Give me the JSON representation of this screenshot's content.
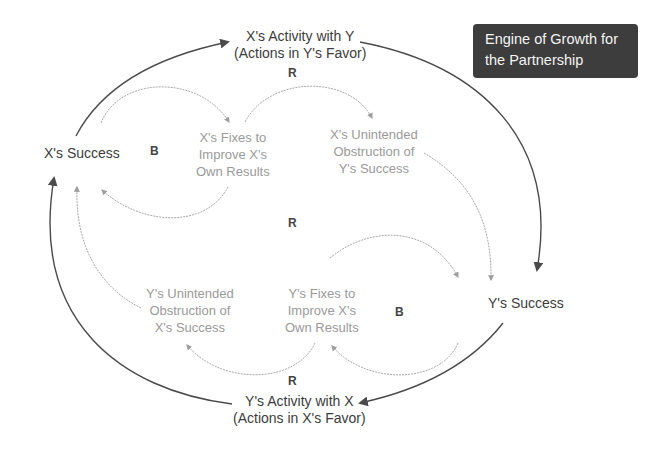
{
  "title_box": {
    "lines": [
      "Engine of Growth for",
      "the Partnership"
    ],
    "background": "#3d3d3d",
    "text_color": "#f4f4f4"
  },
  "nodes": {
    "x_success": {
      "lines": [
        "X's Success"
      ]
    },
    "y_success": {
      "lines": [
        "Y's Success"
      ]
    },
    "x_activity": {
      "lines": [
        "X's Activity with Y",
        "(Actions in Y's Favor)"
      ]
    },
    "y_activity": {
      "lines": [
        "Y's Activity with X",
        "(Actions in X's Favor)"
      ]
    },
    "x_fixes": {
      "lines": [
        "X's Fixes to",
        "Improve X's",
        "Own Results"
      ]
    },
    "x_obstruction": {
      "lines": [
        "X's Unintended",
        "Obstruction of",
        "Y's Success"
      ]
    },
    "y_fixes": {
      "lines": [
        "Y's Fixes to",
        "Improve X's",
        "Own Results"
      ]
    },
    "y_obstruction": {
      "lines": [
        "Y's Unintended",
        "Obstruction of",
        "X's Success"
      ]
    }
  },
  "loop_labels": {
    "top_r": "R",
    "left_b": "B",
    "center_r": "R",
    "right_b": "B",
    "bottom_r": "R"
  },
  "colors": {
    "main_arrow": "#4a4a4a",
    "light_arrow": "#a8a8a8",
    "main_text": "#3c3c3c",
    "light_text": "#9a9a9a"
  }
}
